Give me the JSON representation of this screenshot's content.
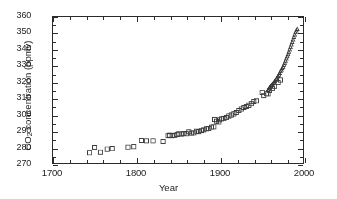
{
  "chart_data": {
    "type": "scatter",
    "title": "",
    "xlabel": "Year",
    "ylabel": "CO2 concentration (ppmv)",
    "ylabel_parts": {
      "prefix": "CO",
      "sub": "2",
      "suffix": " concentration (ppmv)"
    },
    "xlim": [
      1700,
      2000
    ],
    "ylim": [
      270,
      360
    ],
    "xticks": [
      1700,
      1800,
      1900,
      2000
    ],
    "yticks": [
      270,
      280,
      290,
      300,
      310,
      320,
      330,
      340,
      350,
      360
    ],
    "xtick_labels": [
      "1700",
      "1800",
      "1900",
      "2000"
    ],
    "ytick_labels": [
      "270",
      "280",
      "290",
      "300",
      "310",
      "320",
      "330",
      "340",
      "350",
      "360"
    ],
    "x_minor_step": 20,
    "y_minor_step": 5,
    "grid": false,
    "legend": null,
    "marker_color": "#3a3a3a",
    "axis_color": "#2b2b2b",
    "series": [
      {
        "name": "ice-core",
        "marker": "open-square",
        "marker_size": 4.2,
        "points": [
          [
            1744,
            276.3
          ],
          [
            1750,
            279.6
          ],
          [
            1757,
            276.7
          ],
          [
            1765,
            278.6
          ],
          [
            1771,
            278.8
          ],
          [
            1790,
            279.8
          ],
          [
            1797,
            280.0
          ],
          [
            1806,
            283.9
          ],
          [
            1812,
            283.6
          ],
          [
            1820,
            283.6
          ],
          [
            1832,
            283.3
          ],
          [
            1838,
            286.8
          ],
          [
            1840,
            287.2
          ],
          [
            1843,
            286.8
          ],
          [
            1846,
            287.1
          ],
          [
            1849,
            287.6
          ],
          [
            1851,
            288.0
          ],
          [
            1854,
            287.8
          ],
          [
            1857,
            288.2
          ],
          [
            1860,
            288.0
          ],
          [
            1863,
            289.2
          ],
          [
            1866,
            288.4
          ],
          [
            1869,
            288.6
          ],
          [
            1872,
            289.6
          ],
          [
            1875,
            289.3
          ],
          [
            1878,
            290.0
          ],
          [
            1881,
            290.4
          ],
          [
            1884,
            291.1
          ],
          [
            1887,
            291.3
          ],
          [
            1890,
            292.1
          ],
          [
            1893,
            292.3
          ],
          [
            1894,
            296.8
          ],
          [
            1896,
            295.8
          ],
          [
            1899,
            295.3
          ],
          [
            1900,
            296.6
          ],
          [
            1902,
            297.2
          ],
          [
            1905,
            297.4
          ],
          [
            1908,
            298.0
          ],
          [
            1911,
            299.0
          ],
          [
            1914,
            299.6
          ],
          [
            1917,
            300.3
          ],
          [
            1920,
            301.2
          ],
          [
            1923,
            302.4
          ],
          [
            1926,
            303.3
          ],
          [
            1929,
            304.2
          ],
          [
            1932,
            304.8
          ],
          [
            1935,
            305.6
          ],
          [
            1938,
            306.5
          ],
          [
            1941,
            307.9
          ],
          [
            1944,
            308.3
          ],
          [
            1951,
            313.5
          ],
          [
            1953,
            311.6
          ],
          [
            1956,
            312.7
          ],
          [
            1958,
            312.6
          ],
          [
            1960,
            314.7
          ],
          [
            1963,
            316.0
          ],
          [
            1966,
            317.3
          ],
          [
            1970,
            319.6
          ],
          [
            1973,
            321.2
          ]
        ]
      },
      {
        "name": "mauna-loa",
        "marker": "open-triangle",
        "marker_size": 3.0,
        "points": [
          [
            1958,
            315.0
          ],
          [
            1959,
            315.8
          ],
          [
            1960,
            316.5
          ],
          [
            1961,
            317.2
          ],
          [
            1962,
            317.8
          ],
          [
            1963,
            318.4
          ],
          [
            1964,
            319.0
          ],
          [
            1965,
            319.6
          ],
          [
            1966,
            320.3
          ],
          [
            1967,
            321.0
          ],
          [
            1968,
            321.8
          ],
          [
            1969,
            322.7
          ],
          [
            1970,
            323.6
          ],
          [
            1971,
            324.3
          ],
          [
            1972,
            325.2
          ],
          [
            1973,
            326.4
          ],
          [
            1974,
            327.4
          ],
          [
            1975,
            328.3
          ],
          [
            1976,
            329.2
          ],
          [
            1977,
            330.4
          ],
          [
            1978,
            331.6
          ],
          [
            1979,
            332.9
          ],
          [
            1980,
            334.3
          ],
          [
            1981,
            335.6
          ],
          [
            1982,
            336.9
          ],
          [
            1983,
            338.4
          ],
          [
            1984,
            339.9
          ],
          [
            1985,
            341.4
          ],
          [
            1986,
            342.9
          ],
          [
            1987,
            344.4
          ],
          [
            1988,
            346.0
          ],
          [
            1989,
            347.5
          ],
          [
            1990,
            349.0
          ],
          [
            1991,
            350.4
          ],
          [
            1992,
            351.5
          ],
          [
            1993,
            352.5
          ]
        ]
      }
    ]
  }
}
